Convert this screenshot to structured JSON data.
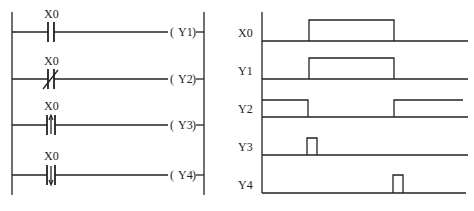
{
  "ladder": {
    "rungs": [
      {
        "contact": "X0",
        "contact_type": "normally-open",
        "coil": "Y1"
      },
      {
        "contact": "X0",
        "contact_type": "normally-closed",
        "coil": "Y2"
      },
      {
        "contact": "X0",
        "contact_type": "rising-edge",
        "coil": "Y3"
      },
      {
        "contact": "X0",
        "contact_type": "falling-edge",
        "coil": "Y4"
      }
    ]
  },
  "timing": {
    "signals": [
      {
        "label": "X0"
      },
      {
        "label": "Y1"
      },
      {
        "label": "Y2"
      },
      {
        "label": "Y3"
      },
      {
        "label": "Y4"
      }
    ]
  },
  "colors": {
    "line": "#222222",
    "background": "#ffffff"
  }
}
